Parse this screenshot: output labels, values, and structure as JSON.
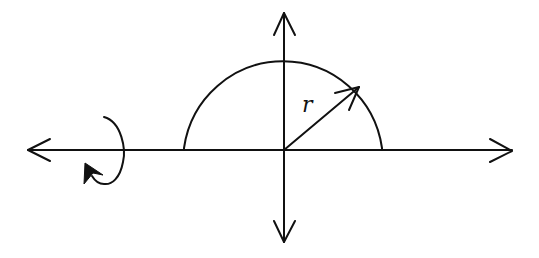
{
  "diagram": {
    "labels": {
      "radius": "r"
    },
    "stroke_color": "#111111",
    "background": "#ffffff",
    "elements": [
      {
        "name": "horizontal-axis",
        "type": "double-arrow",
        "from": [
          28,
          150
        ],
        "to": [
          512,
          150
        ]
      },
      {
        "name": "vertical-axis",
        "type": "double-arrow",
        "from": [
          284,
          13
        ],
        "to": [
          284,
          242
        ]
      },
      {
        "name": "semicircle",
        "type": "arc",
        "center": [
          284,
          150
        ],
        "radius": 100
      },
      {
        "name": "radius-arrow",
        "type": "arrow",
        "from": [
          284,
          150
        ],
        "to": [
          359,
          87
        ],
        "label": "r"
      },
      {
        "name": "rotation-arrow",
        "type": "curved-arrow",
        "around": "horizontal-axis",
        "position_x": 110
      }
    ]
  }
}
